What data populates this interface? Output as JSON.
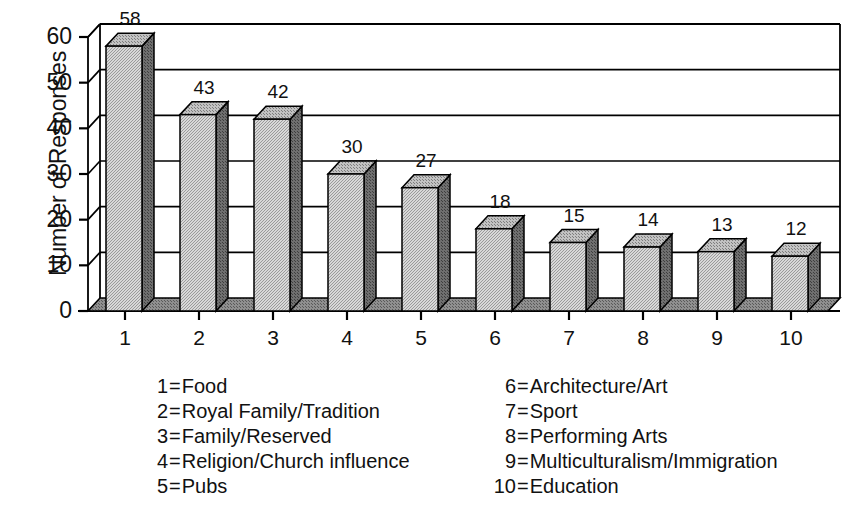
{
  "chart_data": {
    "type": "bar",
    "title": "",
    "subtitle": "",
    "xlabel": "",
    "ylabel": "Number of Responses",
    "categories": [
      "1",
      "2",
      "3",
      "4",
      "5",
      "6",
      "7",
      "8",
      "9",
      "10"
    ],
    "values": [
      58,
      43,
      42,
      30,
      27,
      18,
      15,
      14,
      13,
      12
    ],
    "value_labels": [
      "58",
      "43",
      "42",
      "30",
      "27",
      "18",
      "15",
      "14",
      "13",
      "12"
    ],
    "ylim": [
      0,
      60
    ],
    "yticks": [
      0,
      10,
      20,
      30,
      40,
      50,
      60
    ],
    "ytick_labels": [
      "0",
      "10",
      "20",
      "30",
      "40",
      "50",
      "60"
    ],
    "xtick_labels": [
      "1",
      "2",
      "3",
      "4",
      "5",
      "6",
      "7",
      "8",
      "9",
      "10"
    ],
    "grid": "horizontal",
    "legend_position": "below-chart",
    "style": "3d-column",
    "category_names": [
      "Food",
      "Royal Family/Tradition",
      "Family/Reserved",
      "Religion/Church influence",
      "Pubs",
      "Architecture/Art",
      "Sport",
      "Performing Arts",
      "Multiculturalism/Immigration",
      "Education"
    ]
  },
  "colors": {
    "bar_front": "#c6c6c6",
    "bar_side": "#7a7a7a",
    "bar_top": "#b0b0b0",
    "outline": "#000000",
    "gridline": "#000000",
    "background": "#ffffff",
    "text": "#111111",
    "floor": "#8c8c8c"
  },
  "legend": {
    "columns": [
      {
        "items": [
          {
            "key": "1",
            "eq": "=",
            "text": "Food"
          },
          {
            "key": "2",
            "eq": "=",
            "text": "Royal Family/Tradition"
          },
          {
            "key": "3",
            "eq": "=",
            "text": "Family/Reserved"
          },
          {
            "key": "4",
            "eq": "=",
            "text": "Religion/Church influence"
          },
          {
            "key": "5",
            "eq": "=",
            "text": "Pubs"
          }
        ]
      },
      {
        "items": [
          {
            "key": "6",
            "eq": "=",
            "text": "Architecture/Art"
          },
          {
            "key": "7",
            "eq": "=",
            "text": "Sport"
          },
          {
            "key": "8",
            "eq": "=",
            "text": "Performing Arts"
          },
          {
            "key": "9",
            "eq": "=",
            "text": "Multiculturalism/Immigration"
          },
          {
            "key": "10",
            "eq": "=",
            "text": "Education"
          }
        ]
      }
    ]
  }
}
